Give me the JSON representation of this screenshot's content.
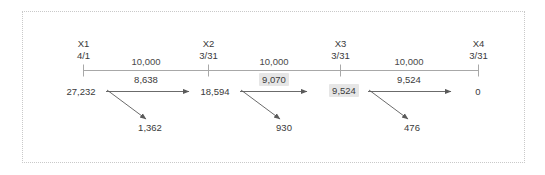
{
  "diagram": {
    "type": "timeline-cashflow",
    "title": "",
    "frame_style": "dotted-border"
  },
  "periods": [
    {
      "name": "X1",
      "date": "4/1"
    },
    {
      "name": "X2",
      "date": "3/31"
    },
    {
      "name": "X3",
      "date": "3/31"
    },
    {
      "name": "X4",
      "date": "3/31"
    }
  ],
  "balances": [
    {
      "value": "27,232",
      "highlighted": false
    },
    {
      "value": "18,594",
      "highlighted": false
    },
    {
      "value": "9,524",
      "highlighted": true
    },
    {
      "value": "0",
      "highlighted": false
    }
  ],
  "segments": [
    {
      "payment": "10,000",
      "principal": "8,638",
      "principal_highlighted": false,
      "interest": "1,362"
    },
    {
      "payment": "10,000",
      "principal": "9,070",
      "principal_highlighted": true,
      "interest": "930"
    },
    {
      "payment": "10,000",
      "principal": "9,524",
      "principal_highlighted": false,
      "interest": "476"
    }
  ],
  "colors": {
    "text": "#3a3a3a",
    "axis": "#9a9a9a",
    "arrow": "#5a5a5a",
    "highlight": "#e6e6e6",
    "frame": "#c9c9c9",
    "background": "#ffffff"
  }
}
